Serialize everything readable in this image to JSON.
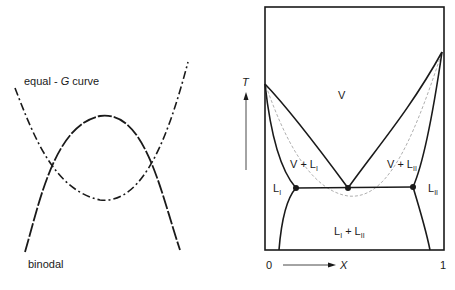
{
  "figure": {
    "left_panel": {
      "title": "Free-energy curves",
      "labels": {
        "equal_g_prefix": "equal - ",
        "equal_g_symbol": "G",
        "equal_g_suffix": " curve",
        "binodal": "binodal"
      },
      "curves": [
        {
          "name": "equal-G curve",
          "style": "dash-dot",
          "shape": "U-shaped (min near x=100,y=200)"
        },
        {
          "name": "binodal",
          "style": "long-dash",
          "shape": "inverted-U (max near x=100,y=116)"
        }
      ]
    },
    "right_panel": {
      "title": "T-X phase diagram",
      "axes": {
        "y_label": "T",
        "x_label": "X",
        "x_min_label": "0",
        "x_max_label": "1"
      },
      "regions": {
        "vapor": "V",
        "v_plus_l1_main": "V + L",
        "v_plus_l1_sub": "I",
        "v_plus_l2_main": "V + L",
        "v_plus_l2_sub": "II",
        "l1_main": "L",
        "l1_sub": "I",
        "l2_main": "L",
        "l2_sub": "II",
        "l1_plus_l2_a": "L",
        "l1_plus_l2_a_sub": "I",
        "l1_plus_l2_plus": " + L",
        "l1_plus_l2_b_sub": "II"
      },
      "points": [
        {
          "name": "left-three-phase-point"
        },
        {
          "name": "heteroazeotrope-point"
        },
        {
          "name": "right-three-phase-point"
        }
      ]
    },
    "colors": {
      "line": "#1a1a1a",
      "dashed_gray": "#9a9a9a",
      "background": "#ffffff"
    }
  }
}
